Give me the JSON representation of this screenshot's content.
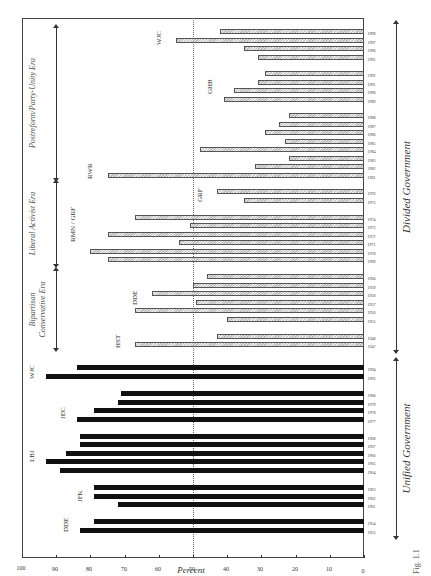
{
  "chart_data": {
    "type": "bar",
    "title": "",
    "xlabel": "",
    "ylabel": "Percent",
    "ylim": [
      0,
      100
    ],
    "yticks": [
      0,
      10,
      20,
      30,
      40,
      50,
      60,
      70,
      80,
      90,
      100
    ],
    "reference_line": 50,
    "orientation": "rotated 90° counterclockwise",
    "figure_label": "Fig. 1.1",
    "series": [
      {
        "name": "Unified Government",
        "style": "solid black",
        "bars": [
          {
            "year": "1953",
            "value": 83,
            "pos": 45
          },
          {
            "year": "1954",
            "value": 79,
            "pos": 54
          },
          {
            "year": "1961",
            "value": 72,
            "pos": 71
          },
          {
            "year": "1962",
            "value": 79,
            "pos": 79
          },
          {
            "year": "1963",
            "value": 79,
            "pos": 88
          },
          {
            "year": "1964",
            "value": 89,
            "pos": 105
          },
          {
            "year": "1965",
            "value": 93,
            "pos": 114
          },
          {
            "year": "1966",
            "value": 87,
            "pos": 122
          },
          {
            "year": "1967",
            "value": 83,
            "pos": 131
          },
          {
            "year": "1968",
            "value": 83,
            "pos": 139
          },
          {
            "year": "1977",
            "value": 84,
            "pos": 156
          },
          {
            "year": "1978",
            "value": 79,
            "pos": 165
          },
          {
            "year": "1979",
            "value": 72,
            "pos": 173
          },
          {
            "year": "1980",
            "value": 71,
            "pos": 182
          },
          {
            "year": "1993",
            "value": 93,
            "pos": 199
          },
          {
            "year": "1994",
            "value": 84,
            "pos": 208
          }
        ]
      },
      {
        "name": "Divided Government",
        "style": "hatched gray",
        "bars": [
          {
            "year": "1947",
            "value": 67,
            "pos": 231
          },
          {
            "year": "1948",
            "value": 43,
            "pos": 239
          },
          {
            "year": "1955",
            "value": 40,
            "pos": 256
          },
          {
            "year": "1956",
            "value": 67,
            "pos": 265
          },
          {
            "year": "1957",
            "value": 49,
            "pos": 273
          },
          {
            "year": "1958",
            "value": 62,
            "pos": 282
          },
          {
            "year": "1959",
            "value": 50,
            "pos": 290
          },
          {
            "year": "1960",
            "value": 46,
            "pos": 299
          },
          {
            "year": "1969",
            "value": 75,
            "pos": 316
          },
          {
            "year": "1970",
            "value": 80,
            "pos": 324
          },
          {
            "year": "1971",
            "value": 54,
            "pos": 333
          },
          {
            "year": "1972",
            "value": 75,
            "pos": 341
          },
          {
            "year": "1973",
            "value": 51,
            "pos": 350
          },
          {
            "year": "1974",
            "value": 67,
            "pos": 358
          },
          {
            "year": "1975",
            "value": 35,
            "pos": 375
          },
          {
            "year": "1976",
            "value": 43,
            "pos": 384
          },
          {
            "year": "1981",
            "value": 75,
            "pos": 400
          },
          {
            "year": "1982",
            "value": 32,
            "pos": 409
          },
          {
            "year": "1983",
            "value": 22,
            "pos": 417
          },
          {
            "year": "1984",
            "value": 48,
            "pos": 426
          },
          {
            "year": "1985",
            "value": 23,
            "pos": 434
          },
          {
            "year": "1986",
            "value": 29,
            "pos": 443
          },
          {
            "year": "1987",
            "value": 25,
            "pos": 451
          },
          {
            "year": "1988",
            "value": 22,
            "pos": 460
          },
          {
            "year": "1989",
            "value": 41,
            "pos": 476
          },
          {
            "year": "1990",
            "value": 38,
            "pos": 485
          },
          {
            "year": "1991",
            "value": 31,
            "pos": 493
          },
          {
            "year": "1992",
            "value": 29,
            "pos": 502
          },
          {
            "year": "1995",
            "value": 31,
            "pos": 518
          },
          {
            "year": "1996",
            "value": 35,
            "pos": 527
          },
          {
            "year": "1997",
            "value": 55,
            "pos": 535
          },
          {
            "year": "1998",
            "value": 42,
            "pos": 544
          }
        ]
      }
    ],
    "president_labels": [
      {
        "text": "DDE",
        "pos": 50,
        "value": 87
      },
      {
        "text": "JFK",
        "pos": 80,
        "value": 83
      },
      {
        "text": "LBJ",
        "pos": 120,
        "value": 97
      },
      {
        "text": "JEC",
        "pos": 163,
        "value": 88
      },
      {
        "text": "WJC",
        "pos": 203,
        "value": 97
      },
      {
        "text": "HST",
        "pos": 234,
        "value": 72
      },
      {
        "text": "DDE",
        "pos": 277,
        "value": 67
      },
      {
        "text": "RMN / GRF",
        "pos": 340,
        "value": 85
      },
      {
        "text": "GRF",
        "pos": 380,
        "value": 48
      },
      {
        "text": "RWR",
        "pos": 403,
        "value": 80
      },
      {
        "text": "GHB",
        "pos": 488,
        "value": 45
      },
      {
        "text": "WJC",
        "pos": 537,
        "value": 60
      }
    ],
    "eras": [
      {
        "label": "Bipartisan Conservative Era",
        "from": 228,
        "to": 305
      },
      {
        "label": "Liberal Activist Era",
        "from": 312,
        "to": 393
      },
      {
        "label": "Postreform/Party-Unity Era",
        "from": 398,
        "to": 548
      }
    ],
    "government_periods": [
      {
        "label": "Unified Government",
        "from": 40,
        "to": 215
      },
      {
        "label": "Divided Government",
        "from": 226,
        "to": 552
      }
    ]
  }
}
